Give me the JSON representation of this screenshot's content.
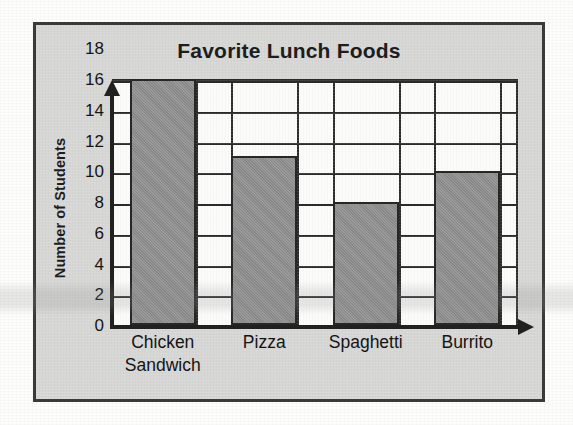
{
  "chart_data": {
    "type": "bar",
    "title": "Favorite Lunch Foods",
    "xlabel": "",
    "ylabel": "Number of Students",
    "categories": [
      "Chicken Sandwich",
      "Pizza",
      "Spaghetti",
      "Burrito"
    ],
    "category_lines": [
      [
        "Chicken",
        "Sandwich"
      ],
      [
        "Pizza"
      ],
      [
        "Spaghetti"
      ],
      [
        "Burrito"
      ]
    ],
    "values": [
      16,
      11,
      8,
      10
    ],
    "ylim": [
      0,
      18
    ],
    "ytick_step": 2,
    "ytick_labels": [
      "18",
      "16",
      "14",
      "12",
      "10",
      "8",
      "6",
      "4",
      "2",
      "0"
    ],
    "ytick_values": [
      18,
      16,
      14,
      12,
      10,
      8,
      6,
      4,
      2,
      0
    ],
    "gridline_values": [
      16,
      14,
      12,
      10,
      8,
      6,
      4,
      2
    ],
    "grid": true,
    "grid_axis": "y",
    "legend": null,
    "legend_position": "none",
    "bar_fill_color": "#8f8f8f",
    "bar_edge_color": "#272727",
    "plot_background_color": "#fbfbfa",
    "figure_background_color": "#d6d6d4",
    "axis_color": "#212121",
    "text_color": "#141414"
  },
  "figure": {
    "frame_color": "#3a3a3a"
  },
  "icons": {
    "y_axis_arrow": "arrow-up-icon",
    "x_axis_arrow": "arrow-right-icon"
  }
}
